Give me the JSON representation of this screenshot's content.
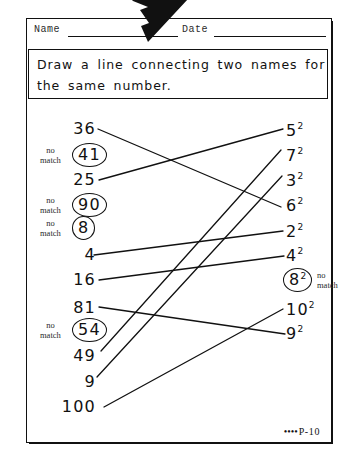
{
  "worksheet": {
    "fields": {
      "name_label": "Name",
      "date_label": "Date"
    },
    "instruction": {
      "line1": "Draw  a line  connecting  two  names  for",
      "line2": "the   same  number."
    },
    "footer": {
      "dots": "••••",
      "page_code": "P-10"
    },
    "nomatch_label": {
      "line1": "no",
      "line2": "match"
    },
    "left_column": [
      {
        "id": "l-36",
        "text": "36",
        "y": 128,
        "circled": false,
        "nomatch": false
      },
      {
        "id": "l-41",
        "text": "41",
        "y": 155,
        "circled": true,
        "nomatch": true
      },
      {
        "id": "l-25",
        "text": "25",
        "y": 179,
        "circled": false,
        "nomatch": false
      },
      {
        "id": "l-90",
        "text": "90",
        "y": 205,
        "circled": true,
        "nomatch": true
      },
      {
        "id": "l-8",
        "text": "8",
        "y": 228,
        "circled": true,
        "nomatch": true
      },
      {
        "id": "l-4",
        "text": "4",
        "y": 254,
        "circled": false,
        "nomatch": false
      },
      {
        "id": "l-16",
        "text": "16",
        "y": 279,
        "circled": false,
        "nomatch": false
      },
      {
        "id": "l-81",
        "text": "81",
        "y": 307,
        "circled": false,
        "nomatch": false
      },
      {
        "id": "l-54",
        "text": "54",
        "y": 330,
        "circled": true,
        "nomatch": true
      },
      {
        "id": "l-49",
        "text": "49",
        "y": 355,
        "circled": false,
        "nomatch": false
      },
      {
        "id": "l-9",
        "text": "9",
        "y": 381,
        "circled": false,
        "nomatch": false
      },
      {
        "id": "l-100",
        "text": "100",
        "y": 406,
        "circled": false,
        "nomatch": false
      }
    ],
    "right_column": [
      {
        "id": "r-5",
        "base": "5",
        "exponent": "2",
        "y": 130,
        "circled": false,
        "nomatch": false
      },
      {
        "id": "r-7",
        "base": "7",
        "exponent": "2",
        "y": 155,
        "circled": false,
        "nomatch": false
      },
      {
        "id": "r-3",
        "base": "3",
        "exponent": "2",
        "y": 180,
        "circled": false,
        "nomatch": false
      },
      {
        "id": "r-6",
        "base": "6",
        "exponent": "2",
        "y": 205,
        "circled": false,
        "nomatch": false
      },
      {
        "id": "r-2",
        "base": "2",
        "exponent": "2",
        "y": 231,
        "circled": false,
        "nomatch": false
      },
      {
        "id": "r-4",
        "base": "4",
        "exponent": "2",
        "y": 255,
        "circled": false,
        "nomatch": false
      },
      {
        "id": "r-8",
        "base": "8",
        "exponent": "2",
        "y": 280,
        "circled": true,
        "nomatch": true
      },
      {
        "id": "r-10",
        "base": "10",
        "exponent": "2",
        "y": 309,
        "circled": false,
        "nomatch": false
      },
      {
        "id": "r-9",
        "base": "9",
        "exponent": "2",
        "y": 333,
        "circled": false,
        "nomatch": false
      }
    ],
    "connections": [
      {
        "from": "36",
        "to": "6 squared",
        "x1": 98,
        "y1": 129,
        "x2": 281,
        "y2": 207
      },
      {
        "from": "25",
        "to": "5 squared",
        "x1": 99,
        "y1": 180,
        "x2": 283,
        "y2": 129
      },
      {
        "from": "4",
        "to": "2 squared",
        "x1": 94,
        "y1": 255,
        "x2": 283,
        "y2": 231
      },
      {
        "from": "16",
        "to": "4 squared",
        "x1": 99,
        "y1": 280,
        "x2": 284,
        "y2": 256
      },
      {
        "from": "81",
        "to": "9 squared",
        "x1": 99,
        "y1": 307,
        "x2": 285,
        "y2": 334
      },
      {
        "from": "49",
        "to": "7 squared",
        "x1": 101,
        "y1": 351,
        "x2": 281,
        "y2": 150
      },
      {
        "from": "9",
        "to": "3 squared",
        "x1": 97,
        "y1": 377,
        "x2": 282,
        "y2": 176
      },
      {
        "from": "100",
        "to": "10 squared",
        "x1": 104,
        "y1": 407,
        "x2": 283,
        "y2": 309
      }
    ],
    "colors": {
      "ink": "#111111",
      "paper": "#ffffff"
    }
  }
}
